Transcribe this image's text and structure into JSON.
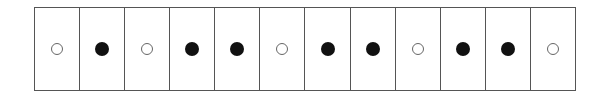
{
  "diagram": {
    "type": "cell-strip",
    "cell_count": 12,
    "colors": {
      "border": "#555555",
      "filled": "#111111",
      "open_stroke": "#666666",
      "background": "#ffffff"
    },
    "cells": [
      {
        "index": 1,
        "state": "open"
      },
      {
        "index": 2,
        "state": "filled"
      },
      {
        "index": 3,
        "state": "open"
      },
      {
        "index": 4,
        "state": "filled"
      },
      {
        "index": 5,
        "state": "filled"
      },
      {
        "index": 6,
        "state": "open"
      },
      {
        "index": 7,
        "state": "filled"
      },
      {
        "index": 8,
        "state": "filled"
      },
      {
        "index": 9,
        "state": "open"
      },
      {
        "index": 10,
        "state": "filled"
      },
      {
        "index": 11,
        "state": "filled"
      },
      {
        "index": 12,
        "state": "open"
      }
    ]
  }
}
